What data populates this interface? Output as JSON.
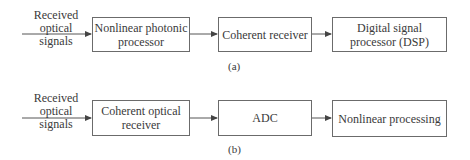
{
  "diagram_a": {
    "input_label_line1": "Received optical",
    "input_label_line2": "signals",
    "blocks": [
      {
        "line1": "Nonlinear photonic",
        "line2": "processor"
      },
      {
        "line1": "Coherent receiver",
        "line2": ""
      },
      {
        "line1": "Digital signal",
        "line2": "processor (DSP)"
      }
    ],
    "caption": "(a)"
  },
  "diagram_b": {
    "input_label_line1": "Received optical",
    "input_label_line2": "signals",
    "blocks": [
      {
        "line1": "Coherent optical",
        "line2": "receiver"
      },
      {
        "line1": "ADC",
        "line2": ""
      },
      {
        "line1": "Nonlinear processing",
        "line2": ""
      }
    ],
    "caption": "(b)"
  },
  "colors": {
    "line": "#555555",
    "text": "#3a3a3a"
  }
}
